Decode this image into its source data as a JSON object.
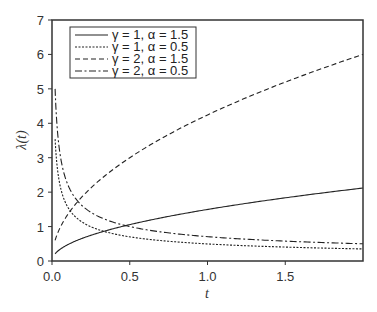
{
  "chart_data": {
    "type": "line",
    "title": "",
    "xlabel": "t",
    "ylabel": "λ(t)",
    "xlim": [
      0,
      2
    ],
    "ylim": [
      0,
      7
    ],
    "xticks": [
      "0.0",
      "0.5",
      "1.0",
      "1.5"
    ],
    "xtick_values": [
      0,
      0.5,
      1.0,
      1.5
    ],
    "yticks": [
      "0",
      "1",
      "2",
      "3",
      "4",
      "5",
      "6",
      "7"
    ],
    "ytick_values": [
      0,
      1,
      2,
      3,
      4,
      5,
      6,
      7
    ],
    "grid": false,
    "legend_position": "upper left",
    "x": [
      0.02,
      0.05,
      0.1,
      0.2,
      0.3,
      0.5,
      0.75,
      1.0,
      1.25,
      1.5,
      1.75,
      2.0
    ],
    "series": [
      {
        "name": "γ = 1, α = 1.5",
        "style": "solid",
        "values": [
          0.21,
          0.34,
          0.47,
          0.67,
          0.82,
          1.06,
          1.3,
          1.5,
          1.68,
          1.84,
          1.98,
          2.12
        ]
      },
      {
        "name": "γ = 1, α = 0.5",
        "style": "dotted",
        "values": [
          3.54,
          2.24,
          1.58,
          1.12,
          0.91,
          0.71,
          0.58,
          0.5,
          0.45,
          0.41,
          0.38,
          0.35
        ]
      },
      {
        "name": "γ = 2, α = 1.5",
        "style": "dashed",
        "values": [
          0.6,
          0.95,
          1.34,
          1.9,
          2.32,
          3.0,
          3.67,
          4.24,
          4.74,
          5.2,
          5.61,
          6.0
        ]
      },
      {
        "name": "γ = 2, α = 0.5",
        "style": "dashdot",
        "values": [
          5.0,
          3.16,
          2.24,
          1.58,
          1.29,
          1.0,
          0.82,
          0.71,
          0.63,
          0.58,
          0.53,
          0.5
        ]
      }
    ]
  },
  "legend": {
    "items": [
      {
        "label": "γ = 1, α = 1.5"
      },
      {
        "label": "γ = 1, α = 0.5"
      },
      {
        "label": "γ = 2, α = 1.5"
      },
      {
        "label": "γ = 2, α = 0.5"
      }
    ]
  },
  "axes": {
    "xlabel": "t",
    "ylabel": "λ(t)"
  }
}
